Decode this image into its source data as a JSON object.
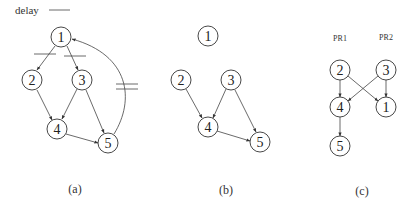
{
  "legend": {
    "label": "delay"
  },
  "panels": [
    {
      "caption": "(a)",
      "nodes": [
        {
          "id": "1",
          "x": 61,
          "y": 37
        },
        {
          "id": "2",
          "x": 32,
          "y": 80
        },
        {
          "id": "3",
          "x": 82,
          "y": 80
        },
        {
          "id": "4",
          "x": 57,
          "y": 129
        },
        {
          "id": "5",
          "x": 108,
          "y": 143
        }
      ],
      "edges": [
        [
          "1",
          "2"
        ],
        [
          "1",
          "3"
        ],
        [
          "2",
          "4"
        ],
        [
          "3",
          "4"
        ],
        [
          "3",
          "5"
        ],
        [
          "4",
          "5"
        ],
        [
          "5",
          "1"
        ]
      ],
      "delayed_edges": [
        [
          "1",
          "2"
        ],
        [
          "1",
          "3"
        ],
        [
          "5",
          "1"
        ]
      ]
    },
    {
      "caption": "(b)",
      "nodes": [
        {
          "id": "1",
          "x": 208,
          "y": 36
        },
        {
          "id": "2",
          "x": 181,
          "y": 80
        },
        {
          "id": "3",
          "x": 231,
          "y": 80
        },
        {
          "id": "4",
          "x": 208,
          "y": 127
        },
        {
          "id": "5",
          "x": 260,
          "y": 142
        }
      ],
      "edges": [
        [
          "2",
          "4"
        ],
        [
          "3",
          "4"
        ],
        [
          "3",
          "5"
        ],
        [
          "4",
          "5"
        ]
      ]
    },
    {
      "caption": "(c)",
      "processors": [
        "PR1",
        "PR2"
      ],
      "nodes": [
        {
          "id": "2",
          "x": 340,
          "y": 70
        },
        {
          "id": "3",
          "x": 386,
          "y": 70
        },
        {
          "id": "4",
          "x": 340,
          "y": 107
        },
        {
          "id": "1",
          "x": 386,
          "y": 107
        },
        {
          "id": "5",
          "x": 340,
          "y": 146
        }
      ],
      "edges": [
        [
          "2",
          "4"
        ],
        [
          "2",
          "1"
        ],
        [
          "3",
          "4"
        ],
        [
          "3",
          "1"
        ],
        [
          "4",
          "5"
        ]
      ]
    }
  ]
}
